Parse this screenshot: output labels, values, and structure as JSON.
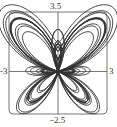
{
  "chart_data": {
    "type": "line",
    "title": "",
    "xlabel": "",
    "ylabel": "",
    "plot_kind": "polar curve (butterfly)",
    "equation": "r = e^{sin θ} − 2cos(4θ) + sin^5((2θ − π)/24)",
    "theta_range": [
      0,
      75.398
    ],
    "xlim": [
      -3,
      3
    ],
    "ylim": [
      -2.5,
      3.5
    ],
    "tick_labels": {
      "xmin": "-3",
      "xmax": "3",
      "ymin": "−2.5",
      "ymax": "3.5"
    },
    "grid": false,
    "legend": null,
    "series": [
      {
        "name": "butterfly",
        "color": "#333333"
      }
    ]
  },
  "colors": {
    "curve": "#333333",
    "axes": "#555555",
    "frame": "#777777",
    "background": "#ffffff"
  }
}
